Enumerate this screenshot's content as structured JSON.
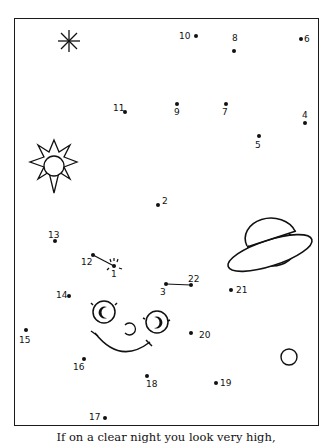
{
  "caption": "If on a clear night you look very high,",
  "colors": {
    "ink": "#111111",
    "paper": "#ffffff"
  },
  "dots": [
    {
      "n": "1",
      "x": 114,
      "y": 266,
      "lx": 111,
      "ly": 270
    },
    {
      "n": "2",
      "x": 158,
      "y": 205,
      "lx": 162,
      "ly": 197
    },
    {
      "n": "3",
      "x": 166,
      "y": 284,
      "lx": 160,
      "ly": 288
    },
    {
      "n": "4",
      "x": 305,
      "y": 123,
      "lx": 302,
      "ly": 111
    },
    {
      "n": "5",
      "x": 259,
      "y": 136,
      "lx": 255,
      "ly": 141
    },
    {
      "n": "6",
      "x": 301,
      "y": 39,
      "lx": 304,
      "ly": 35
    },
    {
      "n": "7",
      "x": 226,
      "y": 104,
      "lx": 222,
      "ly": 108
    },
    {
      "n": "8",
      "x": 234,
      "y": 51,
      "lx": 232,
      "ly": 34
    },
    {
      "n": "9",
      "x": 177,
      "y": 104,
      "lx": 174,
      "ly": 108
    },
    {
      "n": "10",
      "x": 196,
      "y": 36,
      "lx": 179,
      "ly": 32
    },
    {
      "n": "11",
      "x": 125,
      "y": 112,
      "lx": 113,
      "ly": 104
    },
    {
      "n": "12",
      "x": 93,
      "y": 255,
      "lx": 81,
      "ly": 258
    },
    {
      "n": "13",
      "x": 55,
      "y": 241,
      "lx": 48,
      "ly": 231
    },
    {
      "n": "14",
      "x": 69,
      "y": 296,
      "lx": 56,
      "ly": 291
    },
    {
      "n": "15",
      "x": 26,
      "y": 330,
      "lx": 19,
      "ly": 336
    },
    {
      "n": "16",
      "x": 84,
      "y": 359,
      "lx": 73,
      "ly": 363
    },
    {
      "n": "17",
      "x": 105,
      "y": 418,
      "lx": 89,
      "ly": 413
    },
    {
      "n": "18",
      "x": 147,
      "y": 376,
      "lx": 146,
      "ly": 380
    },
    {
      "n": "19",
      "x": 216,
      "y": 383,
      "lx": 220,
      "ly": 379
    },
    {
      "n": "20",
      "x": 191,
      "y": 333,
      "lx": 199,
      "ly": 331
    },
    {
      "n": "21",
      "x": 231,
      "y": 290,
      "lx": 236,
      "ly": 286
    },
    {
      "n": "22",
      "x": 191,
      "y": 285,
      "lx": 188,
      "ly": 275
    }
  ],
  "pre_drawn_lines": [
    {
      "from": "12",
      "to": "1"
    },
    {
      "from": "3",
      "to": "22"
    }
  ],
  "drawings": [
    "asterisk-star",
    "sun",
    "ringed-planet",
    "moon-face",
    "small-circle-moon"
  ]
}
